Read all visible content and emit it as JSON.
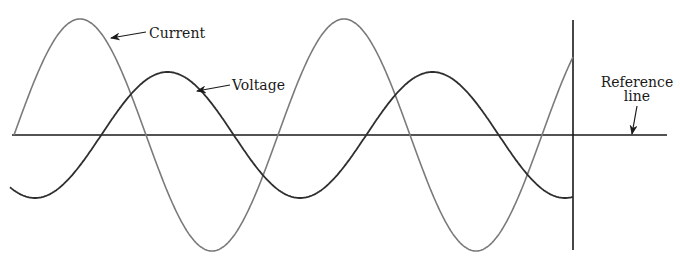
{
  "diagram": {
    "title": "",
    "labels": {
      "current": "Current",
      "voltage": "Voltage",
      "reference_line_1": "Reference",
      "reference_line_2": "line"
    },
    "colors": {
      "current": "#7a7a7a",
      "voltage": "#2e2e2e",
      "axis": "#1a1a1a"
    },
    "reference_line": {
      "x_start": 12,
      "x_end": 667,
      "y": 135
    },
    "vertical_marker": {
      "x": 573,
      "y_top": 20,
      "y_bottom": 250
    },
    "current_wave": {
      "x_start": 14,
      "x_end": 573,
      "center_y": 135,
      "amplitude": 116,
      "period": 264,
      "phase_x": 14,
      "form": "sin"
    },
    "voltage_wave": {
      "x_start": 10,
      "x_end": 573,
      "center_y": 135,
      "amplitude": 63,
      "period": 265,
      "phase_x": 35,
      "form": "neg-cos"
    }
  }
}
